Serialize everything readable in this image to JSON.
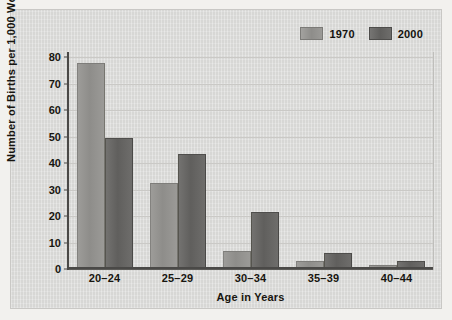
{
  "chart_data": {
    "type": "bar",
    "title": "",
    "xlabel": "Age in Years",
    "ylabel": "Number of Births per 1,000 Women",
    "categories": [
      "20–24",
      "25–29",
      "30–34",
      "35–39",
      "40–44"
    ],
    "series": [
      {
        "name": "1970",
        "color": "#8e8d8a",
        "values": [
          77.5,
          32,
          6.5,
          2.5,
          1
        ]
      },
      {
        "name": "2000",
        "color": "#605f5d",
        "values": [
          49,
          43,
          21,
          5.5,
          2.5
        ]
      }
    ],
    "ylim": [
      0,
      80
    ],
    "yticks": [
      0,
      10,
      20,
      30,
      40,
      50,
      60,
      70,
      80
    ],
    "ytick_labels": [
      "0",
      "10",
      "20",
      "30",
      "40",
      "50",
      "60",
      "70",
      "80"
    ],
    "grid": true,
    "grid_axis": "y",
    "legend_position": "top-right",
    "legend_entries": [
      "1970",
      "2000"
    ]
  },
  "figure": {
    "background_color": "#dededc",
    "plot_background_color": "#dededc",
    "gridline_color": "#cac9c6",
    "axis_color": "#4a4947",
    "text_color": "#17150f"
  }
}
